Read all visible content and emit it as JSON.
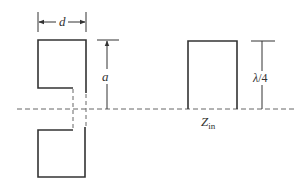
{
  "diagram": {
    "type": "transmission-line-stub-equivalence",
    "colors": {
      "stroke": "#333333",
      "dashed": "#666666",
      "background": "#ffffff"
    },
    "left_figure": {
      "description": "Slotted/folded conductor of width d split by ground plane with gap",
      "dimension_width": {
        "symbol": "d"
      },
      "dimension_height": {
        "symbol": "a"
      }
    },
    "right_figure": {
      "description": "Quarter-wave shorted stub above ground plane",
      "dimension_height": {
        "symbol_main": "λ",
        "symbol_rest": "/4",
        "full": "λ/4"
      },
      "input_impedance": {
        "symbol": "Z",
        "subscript": "in",
        "full": "Z_in"
      }
    },
    "ground_line": {
      "style": "dashed"
    }
  }
}
